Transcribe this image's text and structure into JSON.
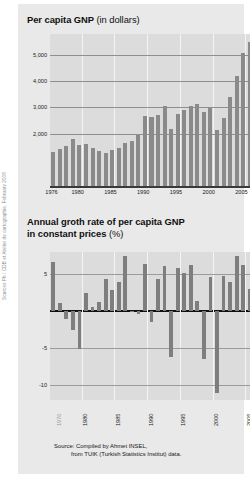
{
  "credit": "Sources Ph / CDB et Atelier de cartographie, February 2008",
  "source": {
    "line1": "Source: Compiled by Ahmet INSEL,",
    "line2": "from TUIK (Turkish Statistics Institut) data."
  },
  "chart_data": [
    {
      "id": "per-capita-gnp",
      "type": "bar",
      "title": "Per capita GNP",
      "title_unit": "(in dollars)",
      "xlabel": "",
      "ylabel": "",
      "ylim": [
        0,
        5800
      ],
      "yticks": [
        2000,
        3000,
        4000,
        5000
      ],
      "ytick_labels": [
        "2,000",
        "3,000",
        "4,000",
        "5,000"
      ],
      "grid": true,
      "xtick_labels": [
        "1976",
        "1980",
        "1985",
        "1990",
        "1995",
        "2000",
        "2005"
      ],
      "xtick_years": [
        1976,
        1980,
        1985,
        1990,
        1995,
        2000,
        2005
      ],
      "categories": [
        1976,
        1977,
        1978,
        1979,
        1980,
        1981,
        1982,
        1983,
        1984,
        1985,
        1986,
        1987,
        1988,
        1989,
        1990,
        1991,
        1992,
        1993,
        1994,
        1995,
        1996,
        1997,
        1998,
        1999,
        2000,
        2001,
        2002,
        2003,
        2004,
        2005,
        2006
      ],
      "values": [
        1310,
        1420,
        1530,
        1810,
        1560,
        1590,
        1450,
        1320,
        1260,
        1370,
        1460,
        1640,
        1700,
        1960,
        2680,
        2620,
        2710,
        3060,
        2180,
        2760,
        2890,
        3060,
        3130,
        2840,
        2960,
        2150,
        2600,
        3380,
        4190,
        5080,
        5480
      ]
    },
    {
      "id": "annual-growth-rate",
      "type": "bar",
      "title": "Annual groth rate of per capita GNP in constant prices",
      "title_line1": "Annual groth rate of per capita GNP",
      "title_line2": "in constant prices",
      "title_unit": "(%)",
      "xlabel": "",
      "ylabel": "",
      "ylim": [
        -12,
        8
      ],
      "yticks": [
        5,
        -5,
        -10
      ],
      "ytick_labels": [
        "5",
        "-5",
        "-10"
      ],
      "grid": true,
      "xtick_labels": [
        "1976",
        "1980",
        "1985",
        "1990",
        "1995",
        "2000",
        "2005",
        "2006"
      ],
      "xtick_years": [
        1976,
        1980,
        1985,
        1990,
        1995,
        2000,
        2005,
        2006
      ],
      "categories": [
        1976,
        1977,
        1978,
        1979,
        1980,
        1981,
        1982,
        1983,
        1984,
        1985,
        1986,
        1987,
        1988,
        1989,
        1990,
        1991,
        1992,
        1993,
        1994,
        1995,
        1996,
        1997,
        1998,
        1999,
        2000,
        2001,
        2002,
        2003,
        2004,
        2005,
        2006
      ],
      "values": [
        6.6,
        1.1,
        -1.1,
        -2.6,
        -5.1,
        2.4,
        0.6,
        1.2,
        4.3,
        2.9,
        4.0,
        7.5,
        -0.1,
        -0.4,
        6.4,
        -1.5,
        4.3,
        6.1,
        -6.2,
        5.9,
        5.2,
        6.2,
        1.4,
        -6.4,
        4.6,
        -11.0,
        4.8,
        3.9,
        7.4,
        6.3,
        3.0
      ]
    }
  ]
}
